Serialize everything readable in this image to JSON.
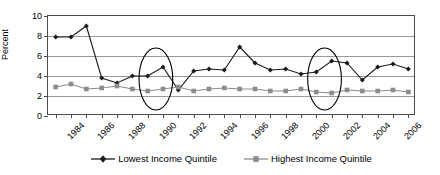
{
  "chart_data": {
    "type": "line",
    "title": "",
    "xlabel": "",
    "ylabel": "Percent",
    "ylim": [
      0,
      10
    ],
    "ytick_values": [
      0,
      2,
      4,
      6,
      8,
      10
    ],
    "ytick_labels": [
      "0",
      "2",
      "4",
      "6",
      "8",
      "10"
    ],
    "grid": true,
    "legend_position": "bottom-center",
    "x": [
      1984,
      1985,
      1986,
      1987,
      1988,
      1989,
      1990,
      1991,
      1992,
      1993,
      1994,
      1995,
      1996,
      1997,
      1998,
      1999,
      2000,
      2001,
      2002,
      2003,
      2004,
      2005,
      2006,
      2007
    ],
    "xtick_labels": [
      "1984",
      "",
      "1986",
      "",
      "1988",
      "",
      "1990",
      "",
      "1992",
      "",
      "1994",
      "",
      "1996",
      "",
      "1998",
      "",
      "2000",
      "",
      "2002",
      "",
      "2004",
      "",
      "2006",
      ""
    ],
    "series": [
      {
        "name": "Lowest Income Quintile",
        "marker": "diamond",
        "color": "#1a1a1a",
        "values": [
          7.9,
          7.9,
          9.0,
          3.8,
          3.3,
          4.0,
          4.0,
          4.9,
          2.6,
          4.5,
          4.7,
          4.6,
          6.9,
          5.3,
          4.6,
          4.7,
          4.2,
          4.4,
          5.5,
          5.3,
          3.6,
          4.9,
          5.2,
          4.7
        ]
      },
      {
        "name": "Highest Income Quintile",
        "marker": "square",
        "color": "#8c8c8c",
        "values": [
          2.9,
          3.2,
          2.7,
          2.8,
          3.0,
          2.7,
          2.5,
          2.7,
          2.9,
          2.5,
          2.7,
          2.8,
          2.7,
          2.7,
          2.5,
          2.5,
          2.7,
          2.4,
          2.3,
          2.6,
          2.5,
          2.5,
          2.6,
          2.4
        ]
      }
    ],
    "annotations": [
      {
        "type": "ellipse",
        "label": "highlight-ellipse-1990-1991",
        "cx_year": 1990.6,
        "cy_value": 3.6,
        "rx_years": 1.1,
        "ry_value": 3.1
      },
      {
        "type": "ellipse",
        "label": "highlight-ellipse-2001-2002",
        "cx_year": 2001.6,
        "cy_value": 3.6,
        "rx_years": 1.1,
        "ry_value": 3.1
      }
    ]
  },
  "legend": {
    "entries": [
      {
        "label": "Lowest Income Quintile"
      },
      {
        "label": "Highest Income Quintile"
      }
    ]
  }
}
